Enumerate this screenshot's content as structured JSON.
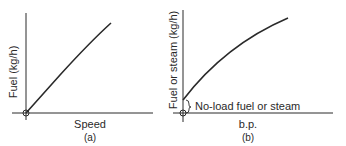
{
  "panels": [
    {
      "id": "a",
      "caption": "(a)",
      "y_axis_label": "Fuel (kg/h)",
      "x_axis_label": "Speed"
    },
    {
      "id": "b",
      "caption": "(b)",
      "y_axis_label": "Fuel or steam (kg/h)",
      "x_axis_label": "b.p.",
      "annotation": "No-load fuel or steam"
    }
  ],
  "colors": {
    "line": "#2a2a2a",
    "background": "#ffffff"
  }
}
